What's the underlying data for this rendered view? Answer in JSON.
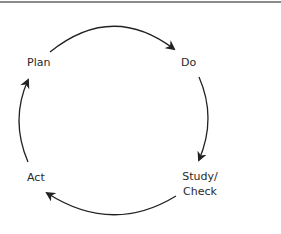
{
  "diagram": {
    "type": "cycle",
    "nodes": [
      {
        "id": "plan",
        "label": "Plan"
      },
      {
        "id": "do",
        "label": "Do"
      },
      {
        "id": "study",
        "label": "Study/",
        "label2": "Check"
      },
      {
        "id": "act",
        "label": "Act"
      }
    ],
    "edges": [
      {
        "from": "Plan",
        "to": "Do"
      },
      {
        "from": "Do",
        "to": "Study/Check"
      },
      {
        "from": "Study/Check",
        "to": "Act"
      },
      {
        "from": "Act",
        "to": "Plan"
      }
    ],
    "colors": {
      "stroke": "#222222",
      "text": "#2a2a2a",
      "rule": "#8a8a8a"
    }
  }
}
